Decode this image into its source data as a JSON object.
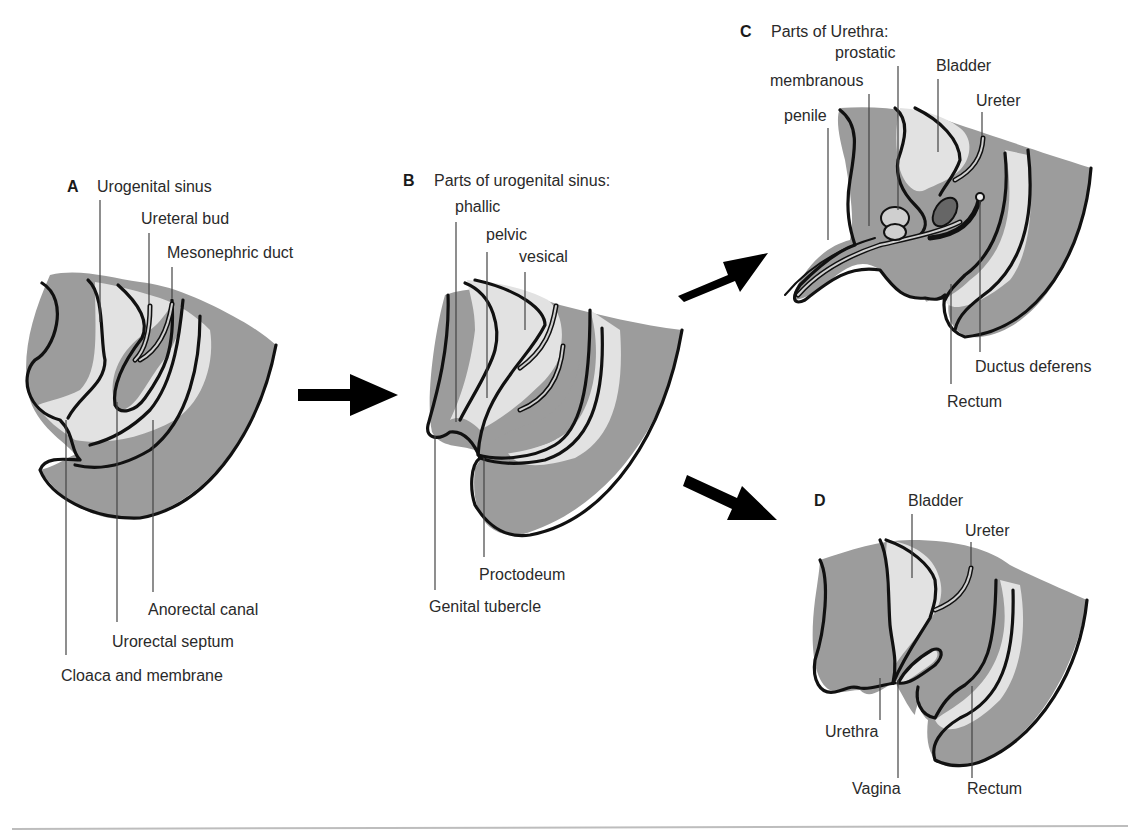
{
  "panels": {
    "A": {
      "letter": "A",
      "labels": {
        "urogenital_sinus": "Urogenital sinus",
        "ureteral_bud": "Ureteral bud",
        "mesonephric_duct": "Mesonephric duct",
        "anorectal_canal": "Anorectal canal",
        "urorectal_septum": "Urorectal septum",
        "cloaca_membrane": "Cloaca and membrane"
      }
    },
    "B": {
      "letter": "B",
      "title": "Parts of urogenital sinus:",
      "labels": {
        "phallic": "phallic",
        "pelvic": "pelvic",
        "vesical": "vesical",
        "proctodeum": "Proctodeum",
        "genital_tubercle": "Genital tubercle"
      }
    },
    "C": {
      "letter": "C",
      "title": "Parts of Urethra:",
      "labels": {
        "prostatic": "prostatic",
        "membranous": "membranous",
        "penile": "penile",
        "bladder": "Bladder",
        "ureter": "Ureter",
        "ductus_deferens": "Ductus deferens",
        "rectum": "Rectum"
      }
    },
    "D": {
      "letter": "D",
      "labels": {
        "bladder": "Bladder",
        "ureter": "Ureter",
        "urethra": "Urethra",
        "vagina": "Vagina",
        "rectum": "Rectum"
      }
    }
  },
  "arrows": [
    {
      "name": "arrow-a-to-b",
      "direction": "right"
    },
    {
      "name": "arrow-b-to-c",
      "direction": "up-right"
    },
    {
      "name": "arrow-b-to-d",
      "direction": "down-right"
    }
  ],
  "colors": {
    "tissue_dark": "#9c9c9c",
    "tissue_light": "#e2e2e2",
    "outline": "#111111",
    "rule": "#bdbdbd"
  }
}
